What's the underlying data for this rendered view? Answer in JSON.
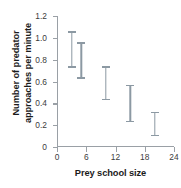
{
  "chart_data": {
    "type": "scatter",
    "title": "",
    "xlabel": "Prey school size",
    "ylabel_line1": "Number of predator",
    "ylabel_line2": "approaches per minute",
    "ylabel": "Number of predator approaches per minute",
    "xlim": [
      0,
      24
    ],
    "ylim": [
      0,
      1.2
    ],
    "grid": false,
    "legend": "none",
    "marker_color": "#5d7585",
    "errorbar_color": "#8c99a3",
    "axis_color": "#9aa0a6",
    "xticks": [
      0,
      6,
      12,
      18,
      24
    ],
    "xtick_labels": [
      "0",
      "6",
      "12",
      "18",
      "24"
    ],
    "yticks": [
      0,
      0.2,
      0.4,
      0.6,
      0.8,
      1.0,
      1.2
    ],
    "ytick_labels": [
      "0",
      "0.2",
      "0.4",
      "0.6",
      "0.8",
      "1.0",
      "1.2"
    ],
    "x": [
      3,
      5,
      10,
      15,
      20
    ],
    "values": [
      0.89,
      0.8,
      0.59,
      0.41,
      0.21
    ],
    "error_low": [
      0.74,
      0.64,
      0.44,
      0.24,
      0.11
    ],
    "error_high": [
      1.06,
      0.96,
      0.74,
      0.57,
      0.32
    ],
    "points": [
      {
        "x": 3,
        "y": 0.89,
        "lo": 0.74,
        "hi": 1.06
      },
      {
        "x": 5,
        "y": 0.8,
        "lo": 0.64,
        "hi": 0.96
      },
      {
        "x": 10,
        "y": 0.59,
        "lo": 0.44,
        "hi": 0.74
      },
      {
        "x": 15,
        "y": 0.41,
        "lo": 0.24,
        "hi": 0.57
      },
      {
        "x": 20,
        "y": 0.21,
        "lo": 0.11,
        "hi": 0.32
      }
    ]
  }
}
